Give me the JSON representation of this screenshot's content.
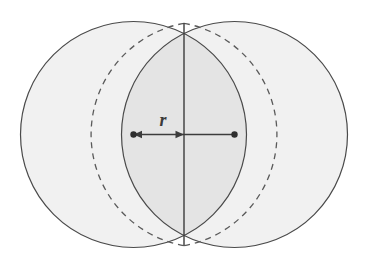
{
  "figure": {
    "background_color": "#ffffff",
    "width": 367,
    "height": 269,
    "labels": {
      "radius": "r"
    },
    "colors": {
      "circle_fill": "#f1f1f1",
      "lens_fill": "#e4e4e4",
      "circle_stroke": "#4a4a4a",
      "dashed_stroke": "#5a5a5a",
      "measure_line": "#3c3c3c",
      "vertical_line": "#3c3c3c",
      "marker_dot": "#2e2e2e",
      "label_color": "#3a3a3a"
    },
    "geometry": {
      "left_circle": {
        "cx": 133.5,
        "cy": 134.5,
        "r": 113
      },
      "right_circle": {
        "cx": 234.5,
        "cy": 134.5,
        "r": 113
      },
      "intersection_top": {
        "x": 184,
        "y": 23.3
      },
      "intersection_bottom": {
        "x": 184,
        "y": 245.7
      },
      "vertical_line": {
        "x": 184,
        "y1": 23.3,
        "y2": 245.7
      },
      "measure_line": {
        "x1": 133.5,
        "x2": 234.5,
        "y": 134.5
      },
      "dot_left": {
        "x": 133.5,
        "y": 134.5
      },
      "dot_right": {
        "x": 234.5,
        "y": 134.5
      },
      "arrowhead_left": {
        "x": 133.5,
        "y": 134.5,
        "direction": "left"
      },
      "arrowhead_right": {
        "x": 184,
        "y": 134.5,
        "direction": "right"
      },
      "radius_label_pos": {
        "x": 163,
        "y": 126
      }
    },
    "stroke_widths": {
      "circle": 1.2,
      "dashed": 1.3,
      "measure": 1.4,
      "vertical": 1.4
    },
    "dash_pattern": "6,5"
  }
}
